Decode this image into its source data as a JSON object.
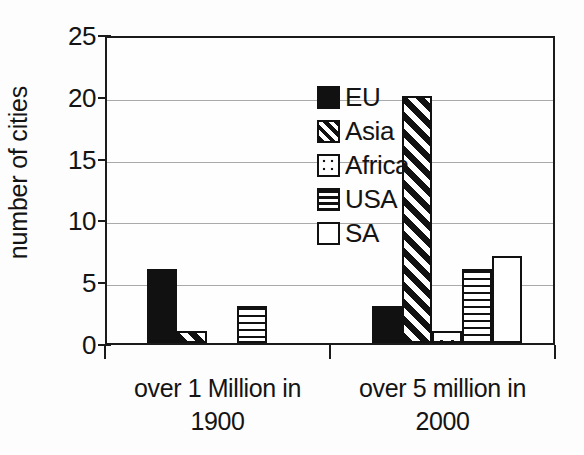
{
  "chart_data": {
    "type": "bar",
    "title": "",
    "xlabel": "",
    "ylabel": "number of cities",
    "ylim": [
      0,
      25
    ],
    "yticks": [
      0,
      5,
      10,
      15,
      20,
      25
    ],
    "ytick_labels": [
      "0",
      "5",
      "10",
      "15",
      "20",
      "25"
    ],
    "grid": true,
    "grid_axis": "y",
    "legend_position": "upper-center-left inside plot",
    "categories": [
      "over 1 Million in 1900",
      "over 5 million in 2000"
    ],
    "category_lines": [
      [
        "over 1 Million in",
        "1900"
      ],
      [
        "over 5 million in",
        "2000"
      ]
    ],
    "series": [
      {
        "name": "EU",
        "pattern": "solid-black",
        "values": [
          6,
          3
        ]
      },
      {
        "name": "Asia",
        "pattern": "diagonal-stripes",
        "values": [
          1,
          20
        ]
      },
      {
        "name": "Africa",
        "pattern": "dotted",
        "values": [
          0,
          1
        ]
      },
      {
        "name": "USA",
        "pattern": "horizontal-stripes",
        "values": [
          3,
          6
        ]
      },
      {
        "name": "SA",
        "pattern": "white-outline",
        "values": [
          0,
          7
        ]
      }
    ]
  },
  "legend": {
    "items": [
      {
        "label": "EU"
      },
      {
        "label": "Asia"
      },
      {
        "label": "Africa"
      },
      {
        "label": "USA"
      },
      {
        "label": "SA"
      }
    ]
  },
  "colors": {
    "ink": "#111111",
    "grid": "#aaaaaa",
    "background": "#fdfdfd"
  }
}
